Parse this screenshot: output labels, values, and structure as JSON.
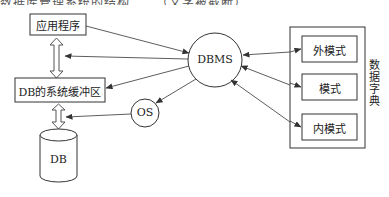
{
  "top_cut_text": "数据库管理系统的结构……（文字被截断）",
  "nodes": {
    "app": {
      "label": "应用程序"
    },
    "buffer": {
      "label": "DB的系统缓冲区"
    },
    "db": {
      "label": "DB"
    },
    "dbms": {
      "label": "DBMS"
    },
    "os": {
      "label": "OS"
    },
    "dictionary": {
      "label": "数据字典",
      "items": [
        {
          "label": "外模式"
        },
        {
          "label": "模式"
        },
        {
          "label": "内模式"
        }
      ]
    }
  },
  "edges": [
    {
      "from": "app",
      "to": "dbms",
      "type": "arrow"
    },
    {
      "from": "dbms",
      "to": "app-buffer-link",
      "type": "arrow"
    },
    {
      "from": "dbms",
      "to": "buffer",
      "type": "arrow"
    },
    {
      "from": "dbms",
      "to": "os",
      "type": "arrow"
    },
    {
      "from": "os",
      "to": "buffer-db-link",
      "type": "arrow"
    },
    {
      "from": "external-schema",
      "to": "dbms",
      "type": "arrow"
    },
    {
      "from": "schema",
      "to": "dbms",
      "type": "arrow"
    },
    {
      "from": "internal-schema",
      "to": "dbms",
      "type": "arrow"
    },
    {
      "from": "app",
      "to": "buffer",
      "type": "double-hollow-arrow"
    },
    {
      "from": "buffer",
      "to": "db",
      "type": "double-hollow-arrow"
    }
  ],
  "colors": {
    "line": "#333333",
    "background": "#ffffff"
  }
}
